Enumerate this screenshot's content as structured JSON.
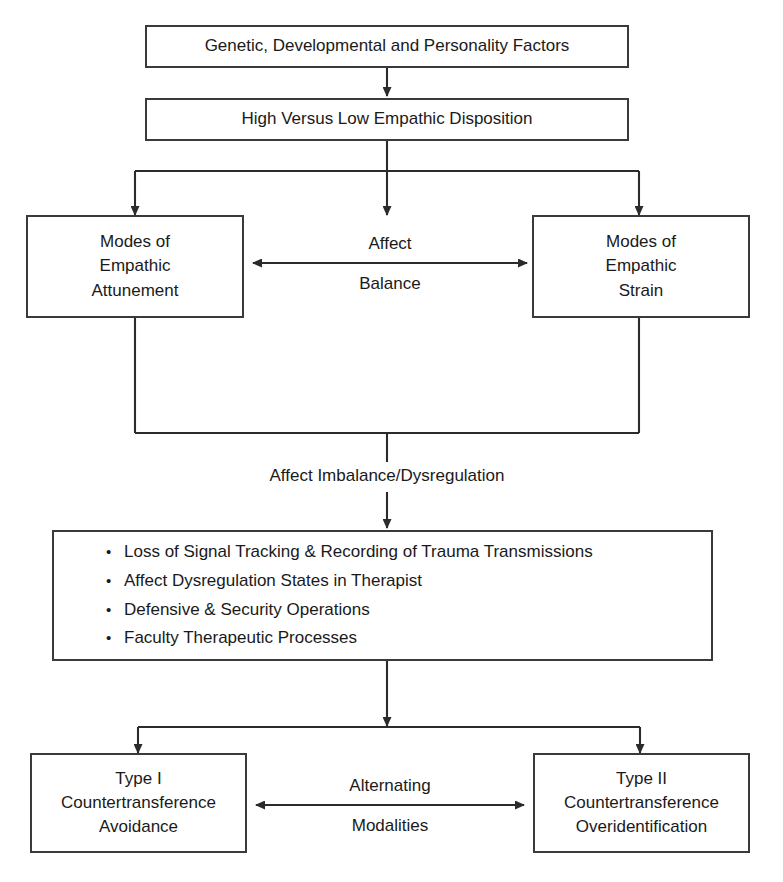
{
  "diagram": {
    "stroke_color": "#3a3a3a",
    "text_color": "#1a1a1a",
    "background_color": "#ffffff",
    "nodes": {
      "genetic_factors": {
        "lines": [
          "Genetic, Developmental and Personality Factors"
        ]
      },
      "empathic_disposition": {
        "lines": [
          "High Versus Low Empathic Disposition"
        ]
      },
      "attunement": {
        "lines": [
          "Modes of",
          "Empathic",
          "Attunement"
        ]
      },
      "strain": {
        "lines": [
          "Modes of",
          "Empathic",
          "Strain"
        ]
      },
      "consequences": {
        "bullets": [
          "Loss of Signal Tracking & Recording of Trauma Transmissions",
          "Affect Dysregulation States in Therapist",
          "Defensive & Security Operations",
          "Faculty Therapeutic Processes"
        ],
        "bullet_glyph": "•"
      },
      "type_one": {
        "lines": [
          "Type I",
          "Countertransference",
          "Avoidance"
        ]
      },
      "type_two": {
        "lines": [
          "Type II",
          "Countertransference",
          "Overidentification"
        ]
      }
    },
    "edge_labels": {
      "affect_balance": {
        "above": "Affect",
        "below": "Balance"
      },
      "affect_imbalance": {
        "text": "Affect Imbalance/Dysregulation"
      },
      "alternating_modalities": {
        "above": "Alternating",
        "below": "Modalities"
      }
    }
  }
}
